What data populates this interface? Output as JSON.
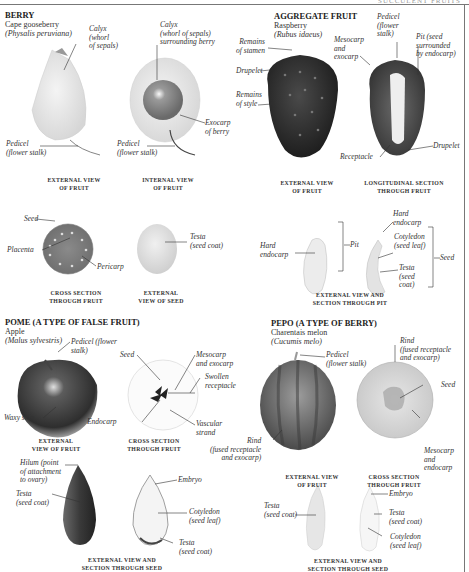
{
  "running_head": "SUCCULENT FRUITS",
  "sections": {
    "berry": {
      "heading": "BERRY",
      "common": "Cape gooseberry",
      "latin": "(Physalis peruviana)",
      "labels": {
        "calyx_ext": "Calyx\n(whorl\nof sepals)",
        "calyx_int": "Calyx\n(whorl of sepals)\nsurrounding berry",
        "exocarp": "Exocarp\nof berry",
        "pedicel_ext": "Pedicel\n(flower stalk)",
        "pedicel_int": "Pedicel\n(flower stalk)",
        "seed": "Seed",
        "placenta": "Placenta",
        "pericarp": "Pericarp",
        "testa": "Testa\n(seed coat)"
      },
      "captions": {
        "external": "EXTERNAL VIEW\nOF FRUIT",
        "internal": "INTERNAL VIEW\nOF FRUIT",
        "cross": "CROSS SECTION\nTHROUGH FRUIT",
        "seed": "EXTERNAL\nVIEW OF SEED"
      }
    },
    "aggregate": {
      "heading": "AGGREGATE FRUIT",
      "common": "Raspberry",
      "latin": "(Rubus idaeus)",
      "labels": {
        "stamen": "Remains\nof stamen",
        "drupelet_left": "Drupelet",
        "style": "Remains\nof style",
        "mesocarp": "Mesocarp\nand\nexocarp",
        "pedicel": "Pedicel\n(flower\nstalk)",
        "pit": "Pit (seed\nsurrounded\nby endocarp)",
        "receptacle": "Receptacle",
        "drupelet_right": "Drupelet",
        "hard_endocarp_left": "Hard\nendocarp",
        "pit_bracket": "Pit",
        "hard_endocarp_right": "Hard\nendocarp",
        "cotyledon": "Cotyledon\n(seed leaf)",
        "testa": "Testa\n(seed\ncoat)",
        "seed_bracket": "Seed"
      },
      "captions": {
        "external": "EXTERNAL VIEW\nOF FRUIT",
        "longitudinal": "LONGITUDINAL SECTION\nTHROUGH FRUIT",
        "pit": "EXTERNAL VIEW AND\nSECTION THROUGH PIT"
      }
    },
    "pome": {
      "heading": "POME (A TYPE OF FALSE FRUIT)",
      "common": "Apple",
      "latin": "(Malus sylvestris)",
      "labels": {
        "pedicel": "Pedicel (flower\nstalk)",
        "waxy": "Waxy skin",
        "seed": "Seed",
        "mesocarp": "Mesocarp\nand exocarp",
        "receptacle": "Swollen\nreceptacle",
        "endocarp": "Endocarp",
        "vascular": "Vascular\nstrand",
        "hilum": "Hilum (point\nof attachment\nto ovary)",
        "testa_left": "Testa\n(seed coat)",
        "embryo": "Embryo",
        "cotyledon": "Cotyledon\n(seed leaf)",
        "testa_right": "Testa\n(seed coat)"
      },
      "captions": {
        "external": "EXTERNAL\nVIEW OF FRUIT",
        "cross": "CROSS SECTION\nTHROUGH FRUIT",
        "seed": "EXTERNAL VIEW AND\nSECTION THROUGH SEED"
      }
    },
    "pepo": {
      "heading": "PEPO (A TYPE OF BERRY)",
      "common": "Charentais melon",
      "latin": "(Cucumis melo)",
      "labels": {
        "pedicel": "Pedicel\n(flower stalk)",
        "rind_top": "Rind\n(fused receptacle\nand exocarp)",
        "seed": "Seed",
        "rind_left": "Rind\n(fused receptacle\nand exocarp)",
        "mesocarp": "Mesocarp\nand\nendocarp",
        "testa_left": "Testa\n(seed coat)",
        "embryo": "Embryo",
        "testa_right": "Testa\n(seed coat)",
        "cotyledon": "Cotyledon\n(seed leaf)"
      },
      "captions": {
        "external": "EXTERNAL VIEW\nOF FRUIT",
        "cross": "CROSS SECTION\nTHROUGH FRUIT",
        "seed": "EXTERNAL VIEW AND\nSECTION THROUGH SEED"
      }
    }
  }
}
